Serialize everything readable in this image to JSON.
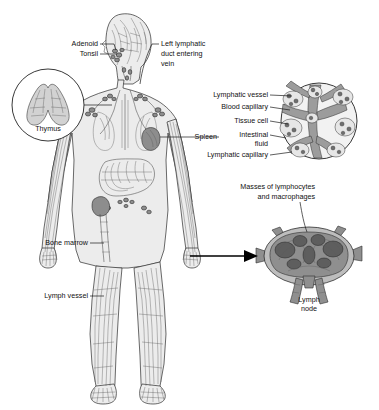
{
  "figure": {
    "background_color": "#ffffff",
    "ink_color": "#1a1a1a"
  },
  "labels": {
    "adenoid": "Adenoid",
    "tonsil": "Tonsil",
    "left_lymphatic_duct_line1": "Left lymphatic",
    "left_lymphatic_duct_line2": "duct entering",
    "left_lymphatic_duct_line3": "vein",
    "thymus": "Thymus",
    "spleen": "Spleen",
    "bone_marrow": "Bone marrow",
    "lymph_vessel": "Lymph vessel",
    "lymphatic_vessel": "Lymphatic vessel",
    "blood_capillary": "Blood capillary",
    "tissue_cell": "Tissue cell",
    "intestinal_line1": "Intestinal",
    "intestinal_line2": "fluid",
    "lymphatic_capillary": "Lymphatic capillary",
    "masses_line1": "Masses of lymphocytes",
    "masses_line2": "and macrophages",
    "lymph_node_line1": "Lymph",
    "lymph_node_line2": "node"
  },
  "insets": {
    "thymus_detail": "thymus-inset",
    "capillary_bed_detail": "capillary-bed-inset",
    "lymph_node_detail": "lymph-node-inset"
  }
}
